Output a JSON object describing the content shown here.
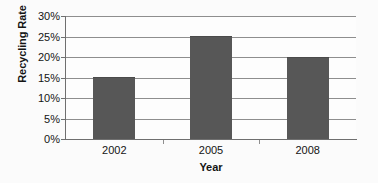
{
  "chart_data": {
    "type": "bar",
    "title": "",
    "xlabel": "Year",
    "ylabel": "Recycling Rate",
    "categories": [
      "2002",
      "2005",
      "2008"
    ],
    "values": [
      15,
      25,
      20
    ],
    "series": [
      {
        "name": "Recycling Rate",
        "values": [
          15,
          25,
          20
        ]
      }
    ],
    "ylim": [
      0,
      30
    ],
    "ytick_values": [
      0,
      5,
      10,
      15,
      20,
      25,
      30
    ],
    "ytick_labels": [
      "0%",
      "5%",
      "10%",
      "15%",
      "20%",
      "25%",
      "30%"
    ],
    "grid": true,
    "grid_axis": "y",
    "legend": false,
    "legend_position": "none",
    "bar_color": "#575757",
    "gridline_color": "#8e8e8e",
    "axis_color": "#6f6f6f",
    "text_color": "#141414",
    "background_color": "#fdfdfd"
  }
}
